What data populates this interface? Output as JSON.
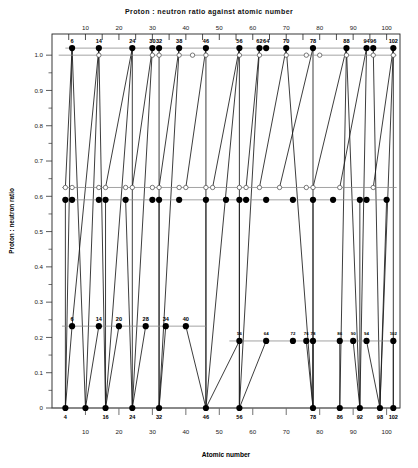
{
  "page": {
    "title": "Proton : neutron ratio against atomic number",
    "background": "#ffffff",
    "ink": "#000000"
  },
  "chart_data": {
    "type": "scatter",
    "title": "Proton : neutron ratio against atomic number",
    "xlabel": "Atomic number",
    "ylabel": "Proton : neutron ratio",
    "xlim": [
      0,
      104
    ],
    "ylim": [
      0,
      1.06
    ],
    "grid": false,
    "legend": "none",
    "axes": {
      "top_ticks_major": [
        10,
        20,
        30,
        40,
        50,
        60,
        70,
        80,
        90,
        100
      ],
      "top_ticks_minor": [
        5,
        15,
        25,
        35,
        45,
        55,
        65,
        75,
        85,
        95
      ],
      "bottom_ticks_major": [
        10,
        20,
        30,
        40,
        50,
        60,
        70,
        80,
        90,
        100
      ],
      "y_ticks_major": [
        "0",
        "0.1",
        "0.2",
        "0.3",
        "0.4",
        "0.5",
        "0.6",
        "0.7",
        "0.8",
        "0.9",
        "1.0"
      ],
      "y_tick_values": [
        0,
        0.1,
        0.2,
        0.3,
        0.4,
        0.5,
        0.6,
        0.7,
        0.8,
        0.9,
        1.0
      ],
      "y_minor_step": 0.05
    },
    "series": [
      {
        "name": "top-row-filled",
        "marker": "filled-circle",
        "y": 1.02,
        "labelled": true,
        "x": [
          6,
          14,
          24,
          30,
          32,
          38,
          46,
          56,
          62,
          64,
          70,
          78,
          88,
          94,
          96,
          102
        ],
        "labels": [
          "6",
          "14",
          "24",
          "30",
          "32",
          "38",
          "46",
          "56",
          "62",
          "64",
          "70",
          "78",
          "88",
          "94",
          "96",
          "102"
        ]
      },
      {
        "name": "top-row-open",
        "marker": "open-circle",
        "y": 1.0,
        "labelled": false,
        "x": [
          14,
          30,
          32,
          38,
          42,
          46,
          56,
          62,
          70,
          76,
          80,
          88,
          96,
          102
        ],
        "labels": []
      },
      {
        "name": "upper-middle-open",
        "marker": "open-circle",
        "y": 0.625,
        "labelled": false,
        "x": [
          4,
          6,
          14,
          16,
          22,
          24,
          30,
          32,
          38,
          40,
          46,
          48,
          56,
          58,
          62,
          68,
          76,
          78,
          86,
          96
        ],
        "labels": []
      },
      {
        "name": "upper-middle-filled",
        "marker": "filled-circle",
        "y": 0.59,
        "labelled": false,
        "x": [
          4,
          6,
          14,
          16,
          22,
          30,
          32,
          38,
          46,
          52,
          56,
          58,
          64,
          72,
          78,
          84,
          92,
          94,
          100
        ],
        "labels": []
      },
      {
        "name": "lower-left-filled",
        "marker": "filled-circle",
        "y": 0.232,
        "labelled": true,
        "x": [
          6,
          14,
          20,
          28,
          34,
          40
        ],
        "labels": [
          "6",
          "14",
          "20",
          "28",
          "34",
          "40"
        ]
      },
      {
        "name": "lower-right-filled",
        "marker": "filled-circle",
        "y": 0.19,
        "labelled": true,
        "x": [
          56,
          64,
          72,
          76,
          78,
          86,
          90,
          94,
          102
        ],
        "labels": [
          "56",
          "64",
          "72",
          "76",
          "78",
          "86",
          "90",
          "94",
          "102"
        ]
      },
      {
        "name": "baseline-filled",
        "marker": "filled-circle",
        "y": 0.0,
        "labelled": true,
        "x": [
          4,
          10,
          16,
          24,
          32,
          46,
          56,
          78,
          86,
          92,
          98,
          102
        ],
        "labels": [
          "4",
          "",
          "16",
          "24",
          "32",
          "46",
          "56",
          "78",
          "86",
          "92",
          "98",
          "102"
        ]
      }
    ],
    "reference_lines": [
      {
        "name": "line-top-filled",
        "y": 1.02,
        "x_from": 4,
        "x_to": 103
      },
      {
        "name": "line-top-open",
        "y": 1.0,
        "x_from": 2,
        "x_to": 103
      },
      {
        "name": "line-mid-open",
        "y": 0.625,
        "x_from": 3,
        "x_to": 103
      },
      {
        "name": "line-mid-filled",
        "y": 0.59,
        "x_from": 3,
        "x_to": 101
      },
      {
        "name": "line-low-left",
        "y": 0.232,
        "x_from": 3,
        "x_to": 46
      },
      {
        "name": "line-low-right",
        "y": 0.19,
        "x_from": 53,
        "x_to": 103
      },
      {
        "name": "line-baseline",
        "y": 0.0,
        "x_from": 2,
        "x_to": 103
      }
    ],
    "connectors": [
      {
        "x1": 6,
        "y1": 1.02,
        "x2": 4,
        "y2": 0.0
      },
      {
        "x1": 6,
        "y1": 1.02,
        "x2": 10,
        "y2": 0.0
      },
      {
        "x1": 14,
        "y1": 1.02,
        "x2": 10,
        "y2": 0.0
      },
      {
        "x1": 14,
        "y1": 1.02,
        "x2": 16,
        "y2": 0.0
      },
      {
        "x1": 24,
        "y1": 1.02,
        "x2": 16,
        "y2": 0.0
      },
      {
        "x1": 24,
        "y1": 1.02,
        "x2": 24,
        "y2": 0.0
      },
      {
        "x1": 30,
        "y1": 1.02,
        "x2": 24,
        "y2": 0.0
      },
      {
        "x1": 32,
        "y1": 1.02,
        "x2": 32,
        "y2": 0.0
      },
      {
        "x1": 38,
        "y1": 1.02,
        "x2": 32,
        "y2": 0.0
      },
      {
        "x1": 46,
        "y1": 1.02,
        "x2": 46,
        "y2": 0.0
      },
      {
        "x1": 56,
        "y1": 1.02,
        "x2": 46,
        "y2": 0.0
      },
      {
        "x1": 56,
        "y1": 1.02,
        "x2": 56,
        "y2": 0.0
      },
      {
        "x1": 62,
        "y1": 1.02,
        "x2": 56,
        "y2": 0.0
      },
      {
        "x1": 70,
        "y1": 1.02,
        "x2": 78,
        "y2": 0.0
      },
      {
        "x1": 78,
        "y1": 1.02,
        "x2": 78,
        "y2": 0.0
      },
      {
        "x1": 88,
        "y1": 1.02,
        "x2": 86,
        "y2": 0.0
      },
      {
        "x1": 88,
        "y1": 1.02,
        "x2": 92,
        "y2": 0.0
      },
      {
        "x1": 94,
        "y1": 1.02,
        "x2": 92,
        "y2": 0.0
      },
      {
        "x1": 96,
        "y1": 1.02,
        "x2": 98,
        "y2": 0.0
      },
      {
        "x1": 102,
        "y1": 1.02,
        "x2": 98,
        "y2": 0.0
      },
      {
        "x1": 102,
        "y1": 1.02,
        "x2": 102,
        "y2": 0.0
      },
      {
        "x1": 6,
        "y1": 0.232,
        "x2": 4,
        "y2": 0.0
      },
      {
        "x1": 6,
        "y1": 0.232,
        "x2": 14,
        "y2": 1.02
      },
      {
        "x1": 14,
        "y1": 0.232,
        "x2": 10,
        "y2": 0.0
      },
      {
        "x1": 20,
        "y1": 0.232,
        "x2": 16,
        "y2": 0.0
      },
      {
        "x1": 28,
        "y1": 0.232,
        "x2": 24,
        "y2": 0.0
      },
      {
        "x1": 34,
        "y1": 0.232,
        "x2": 32,
        "y2": 0.0
      },
      {
        "x1": 40,
        "y1": 0.232,
        "x2": 46,
        "y2": 0.0
      },
      {
        "x1": 56,
        "y1": 0.19,
        "x2": 46,
        "y2": 0.0
      },
      {
        "x1": 64,
        "y1": 0.19,
        "x2": 56,
        "y2": 0.0
      },
      {
        "x1": 76,
        "y1": 0.19,
        "x2": 78,
        "y2": 0.0
      },
      {
        "x1": 78,
        "y1": 0.19,
        "x2": 78,
        "y2": 0.0
      },
      {
        "x1": 86,
        "y1": 0.19,
        "x2": 86,
        "y2": 0.0
      },
      {
        "x1": 90,
        "y1": 0.19,
        "x2": 92,
        "y2": 0.0
      },
      {
        "x1": 94,
        "y1": 0.19,
        "x2": 98,
        "y2": 0.0
      },
      {
        "x1": 102,
        "y1": 0.19,
        "x2": 102,
        "y2": 0.0
      },
      {
        "x1": 4,
        "y1": 0.625,
        "x2": 6,
        "y2": 1.02
      },
      {
        "x1": 16,
        "y1": 0.625,
        "x2": 24,
        "y2": 1.02
      },
      {
        "x1": 24,
        "y1": 0.625,
        "x2": 30,
        "y2": 1.02
      },
      {
        "x1": 32,
        "y1": 0.625,
        "x2": 38,
        "y2": 1.02
      },
      {
        "x1": 40,
        "y1": 0.625,
        "x2": 46,
        "y2": 1.02
      },
      {
        "x1": 48,
        "y1": 0.625,
        "x2": 56,
        "y2": 1.02
      },
      {
        "x1": 58,
        "y1": 0.625,
        "x2": 62,
        "y2": 1.02
      },
      {
        "x1": 62,
        "y1": 0.625,
        "x2": 70,
        "y2": 1.02
      },
      {
        "x1": 68,
        "y1": 0.625,
        "x2": 78,
        "y2": 1.02
      },
      {
        "x1": 78,
        "y1": 0.625,
        "x2": 88,
        "y2": 1.02
      },
      {
        "x1": 86,
        "y1": 0.625,
        "x2": 94,
        "y2": 1.02
      },
      {
        "x1": 96,
        "y1": 0.625,
        "x2": 102,
        "y2": 1.02
      },
      {
        "x1": 4,
        "y1": 0.59,
        "x2": 4,
        "y2": 0.0
      },
      {
        "x1": 16,
        "y1": 0.59,
        "x2": 16,
        "y2": 0.0
      },
      {
        "x1": 22,
        "y1": 0.59,
        "x2": 24,
        "y2": 0.0
      },
      {
        "x1": 32,
        "y1": 0.59,
        "x2": 32,
        "y2": 0.0
      },
      {
        "x1": 46,
        "y1": 0.59,
        "x2": 46,
        "y2": 0.0
      },
      {
        "x1": 56,
        "y1": 0.59,
        "x2": 56,
        "y2": 0.0
      },
      {
        "x1": 78,
        "y1": 0.59,
        "x2": 78,
        "y2": 0.0
      },
      {
        "x1": 92,
        "y1": 0.59,
        "x2": 92,
        "y2": 0.0
      },
      {
        "x1": 100,
        "y1": 0.59,
        "x2": 98,
        "y2": 0.0
      }
    ]
  }
}
